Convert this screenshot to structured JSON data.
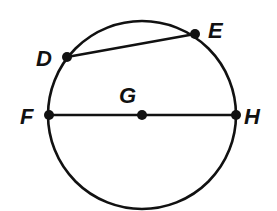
{
  "diagram": {
    "type": "circle-geometry",
    "stroke_color": "#111111",
    "circle": {
      "center": "G",
      "cx": 142,
      "cy": 115,
      "r": 94
    },
    "points": [
      {
        "label": "D",
        "x": 67,
        "y": 57,
        "label_x": 36,
        "label_y": 66
      },
      {
        "label": "E",
        "x": 195,
        "y": 34,
        "label_x": 208,
        "label_y": 38
      },
      {
        "label": "G",
        "x": 142,
        "y": 115,
        "label_x": 119,
        "label_y": 103
      },
      {
        "label": "F",
        "x": 49,
        "y": 115,
        "label_x": 20,
        "label_y": 124
      },
      {
        "label": "H",
        "x": 236,
        "y": 115,
        "label_x": 244,
        "label_y": 124
      }
    ],
    "segments": [
      {
        "name": "chord-DE",
        "from": "D",
        "to": "E"
      },
      {
        "name": "diameter-FH",
        "from": "F",
        "to": "H"
      }
    ]
  }
}
